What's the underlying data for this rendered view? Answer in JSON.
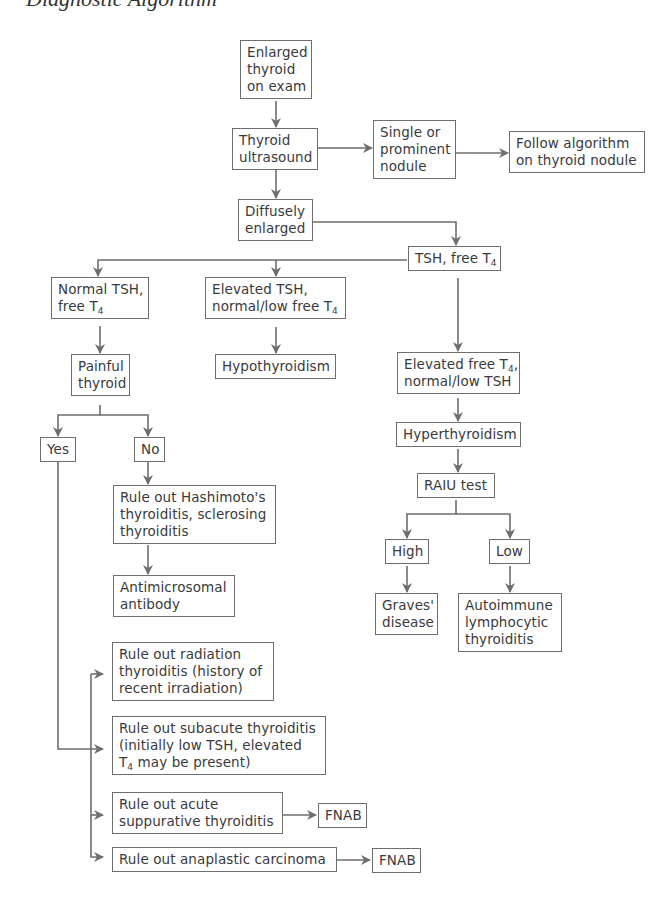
{
  "title": "Diagnostic Algorithm",
  "nodes": {
    "enlarged": [
      "Enlarged",
      "thyroid",
      "on exam"
    ],
    "ultrasound": [
      "Thyroid",
      "ultrasound"
    ],
    "single_nodule": [
      "Single or",
      "prominent",
      "nodule"
    ],
    "follow_algo": [
      "Follow algorithm",
      "on thyroid nodule"
    ],
    "diffuse": [
      "Diffusely",
      "enlarged"
    ],
    "tsh_t4": {
      "text": "TSH, free T",
      "sub": "4"
    },
    "normal_tsh": {
      "line1": "Normal TSH,",
      "line2": "free T",
      "sub": "4"
    },
    "elevated_tsh": {
      "line1": "Elevated TSH,",
      "line2": "normal/low free T",
      "sub": "4"
    },
    "hypothyroidism": "Hypothyroidism",
    "elevated_t4": {
      "line1": "Elevated free T",
      "sub": "4",
      "line1_end": ",",
      "line2": "normal/low TSH"
    },
    "painful": [
      "Painful",
      "thyroid"
    ],
    "yes": "Yes",
    "no": "No",
    "hyperthyroidism": "Hyperthyroidism",
    "raiu": "RAIU test",
    "high": "High",
    "low": "Low",
    "graves": [
      "Graves'",
      "disease"
    ],
    "autoimmune": [
      "Autoimmune",
      "lymphocytic",
      "thyroiditis"
    ],
    "hashimoto": [
      "Rule out Hashimoto's",
      "thyroiditis, sclerosing",
      "thyroiditis"
    ],
    "antimicrosomal": [
      "Antimicrosomal",
      "antibody"
    ],
    "radiation": [
      "Rule out radiation",
      "thyroiditis (history of",
      "recent irradiation)"
    ],
    "subacute": {
      "line1": "Rule out subacute thyroiditis",
      "line2": "(initially low TSH, elevated",
      "line3_pre": "T",
      "sub": "4",
      "line3_post": " may be present)"
    },
    "acute": [
      "Rule out acute",
      "suppurative thyroiditis"
    ],
    "fnab1": "FNAB",
    "anaplastic": "Rule out anaplastic carcinoma",
    "fnab2": "FNAB"
  },
  "colors": {
    "line": "#6e6e6e",
    "text": "#3a3a3a",
    "background": "#ffffff"
  }
}
